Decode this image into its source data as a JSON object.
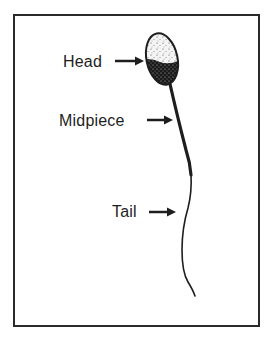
{
  "diagram": {
    "labels": [
      {
        "id": "head",
        "text": "Head"
      },
      {
        "id": "midpiece",
        "text": "Midpiece"
      },
      {
        "id": "tail",
        "text": "Tail"
      }
    ],
    "colors": {
      "line": "#1e1e1e",
      "border": "#2a2a2a",
      "background": "#ffffff"
    }
  }
}
